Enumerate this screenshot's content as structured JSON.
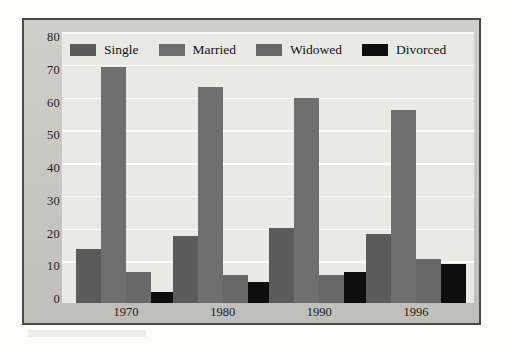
{
  "chart_data": {
    "type": "bar",
    "title": "",
    "subtitle": "",
    "xlabel": "",
    "ylabel": "",
    "categories": [
      "1970",
      "1980",
      "1990",
      "1996"
    ],
    "series": [
      {
        "name": "Single",
        "values": [
          16.5,
          20.5,
          23.0,
          21.0
        ],
        "color": "#5b5b5b"
      },
      {
        "name": "Married",
        "values": [
          72.0,
          66.0,
          62.5,
          59.0
        ],
        "color": "#6f6f6f"
      },
      {
        "name": "Widowed",
        "values": [
          9.5,
          8.5,
          8.5,
          13.5
        ],
        "color": "#686868"
      },
      {
        "name": "Divorced",
        "values": [
          3.5,
          6.5,
          9.5,
          12.0
        ],
        "color": "#0e0e0e"
      }
    ],
    "ylim": [
      0,
      80
    ],
    "yticks": [
      0,
      10,
      20,
      30,
      40,
      50,
      60,
      70,
      80
    ],
    "ytick_labels": [
      "0",
      "10",
      "20",
      "30",
      "40",
      "50",
      "60",
      "70",
      "80"
    ],
    "grid": true,
    "grid_axis": "y",
    "legend_position": "top-inside",
    "legend": [
      "Single",
      "Married",
      "Widowed",
      "Divorced"
    ]
  },
  "style": {
    "panel_background": "#c9c9c4",
    "plot_background": "#e9e9e6",
    "gridline_color": "#fbfbfa",
    "border_color": "#4a4a48",
    "text_color": "#1c1c1c"
  }
}
